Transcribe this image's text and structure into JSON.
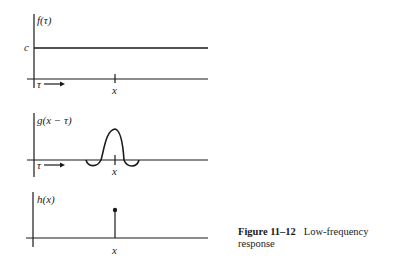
{
  "figure": {
    "number": "Figure 11–12",
    "caption": "Low-frequency response"
  },
  "panels": [
    {
      "ylabel": "f(τ)",
      "level_label": "c",
      "axis_var": "τ",
      "arrow": "→",
      "x_mark": "x"
    },
    {
      "ylabel": "g(x − τ)",
      "axis_var": "τ",
      "arrow": "→",
      "x_mark": "x"
    },
    {
      "ylabel": "h(x)",
      "x_mark": "x"
    }
  ],
  "colors": {
    "ink": "#1a1a1a",
    "background": "#ffffff"
  }
}
